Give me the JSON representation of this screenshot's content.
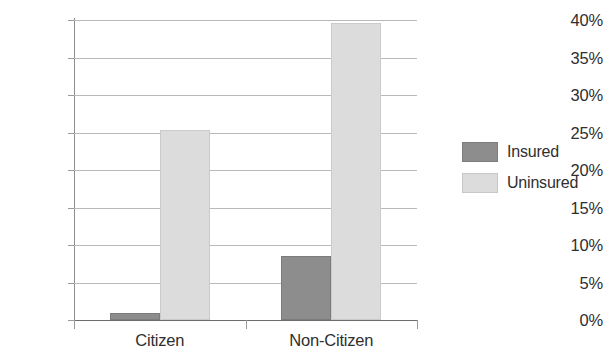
{
  "chart_data": {
    "type": "bar",
    "title": "",
    "subtitle": "",
    "xlabel": "",
    "ylabel": "",
    "categories": [
      "Citizen",
      "Non-Citizen"
    ],
    "series": [
      {
        "name": "Insured",
        "color": "#8d8d8d",
        "values": [
          1.0,
          8.5
        ]
      },
      {
        "name": "Uninsured",
        "color": "#dcdcdc",
        "values": [
          25.3,
          39.6
        ]
      }
    ],
    "ylim": [
      0,
      40
    ],
    "ytick_values": [
      0,
      5,
      10,
      15,
      20,
      25,
      30,
      35,
      40
    ],
    "ytick_labels": [
      "0%",
      "5%",
      "10%",
      "15%",
      "20%",
      "25%",
      "30%",
      "35%",
      "40%"
    ],
    "grid": true,
    "legend_position": "right",
    "legend_entries": [
      "Insured",
      "Uninsured"
    ]
  },
  "axes": {
    "y_labels": [
      "40%",
      "35%",
      "30%",
      "25%",
      "20%",
      "15%",
      "10%",
      "5%",
      "0%"
    ],
    "x_labels": [
      "Citizen",
      "Non-Citizen"
    ]
  },
  "legend": {
    "items": [
      {
        "label": "Insured",
        "swatch": "insured-swatch"
      },
      {
        "label": "Uninsured",
        "swatch": "uninsured-swatch"
      }
    ]
  },
  "colors": {
    "insured": "#8d8d8d",
    "uninsured": "#dcdcdc",
    "grid": "#b9b9b9",
    "axis": "#8d8d8d",
    "text": "#2f2f2f",
    "background": "#ffffff"
  }
}
